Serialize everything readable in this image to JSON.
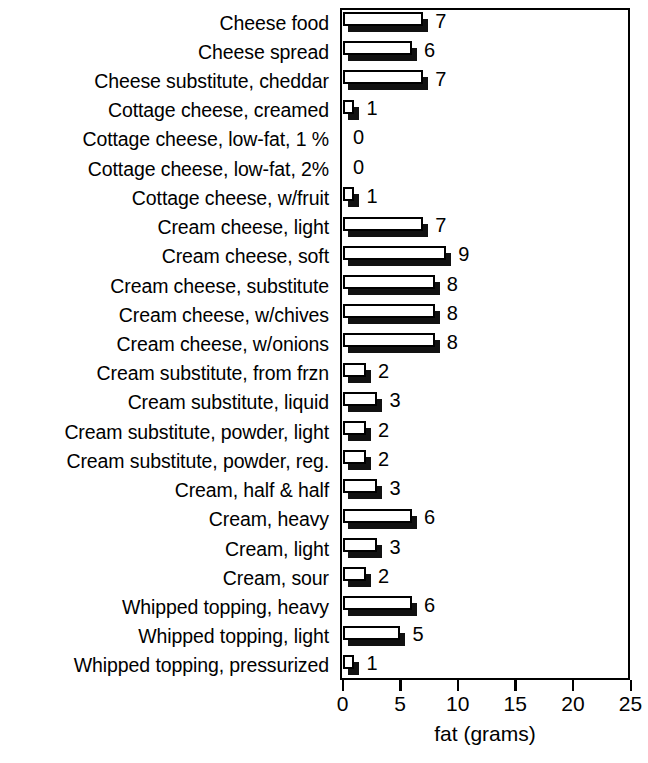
{
  "chart_data": {
    "type": "bar",
    "orientation": "horizontal",
    "title": "",
    "xlabel": "fat (grams)",
    "ylabel": "",
    "xlim": [
      0,
      25
    ],
    "xticks": [
      0,
      5,
      10,
      15,
      20,
      25
    ],
    "xtick_labels": [
      "0",
      "5",
      "10",
      "15",
      "20",
      "25"
    ],
    "grid": false,
    "legend": null,
    "categories": [
      "Cheese food",
      "Cheese spread",
      "Cheese substitute, cheddar",
      "Cottage cheese, creamed",
      "Cottage cheese, low-fat, 1 %",
      "Cottage cheese, low-fat, 2%",
      "Cottage cheese, w/fruit",
      "Cream cheese, light",
      "Cream cheese, soft",
      "Cream cheese, substitute",
      "Cream cheese, w/chives",
      "Cream cheese, w/onions",
      "Cream substitute, from frzn",
      "Cream substitute, liquid",
      "Cream substitute, powder, light",
      "Cream substitute, powder, reg.",
      "Cream, half & half",
      "Cream, heavy",
      "Cream, light",
      "Cream, sour",
      "Whipped topping, heavy",
      "Whipped topping, light",
      "Whipped topping, pressurized"
    ],
    "values": [
      7,
      6,
      7,
      1,
      0,
      0,
      1,
      7,
      9,
      8,
      8,
      8,
      2,
      3,
      2,
      2,
      3,
      6,
      3,
      2,
      6,
      5,
      1
    ],
    "value_labels": [
      "7",
      "6",
      "7",
      "1",
      "0",
      "0",
      "1",
      "7",
      "9",
      "8",
      "8",
      "8",
      "2",
      "3",
      "2",
      "2",
      "3",
      "6",
      "3",
      "2",
      "6",
      "5",
      "1"
    ],
    "colors": {
      "bar_face": "#ffffff",
      "bar_outline": "#000000",
      "bar_shadow": "#111111",
      "axis": "#000000",
      "text": "#000000",
      "background": "#ffffff"
    }
  }
}
